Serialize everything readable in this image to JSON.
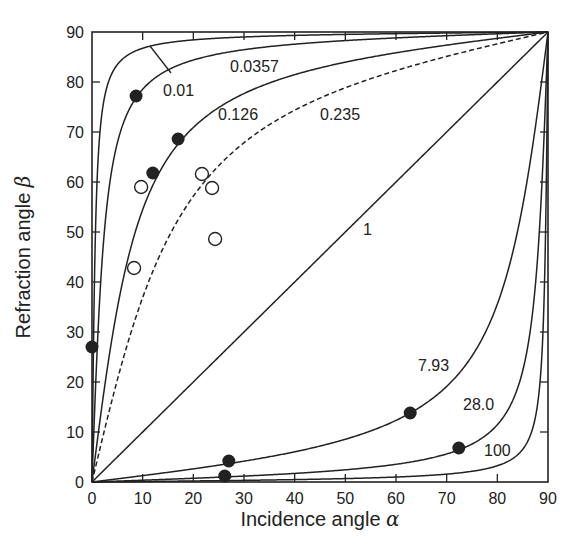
{
  "chart_data": {
    "type": "line",
    "title": "",
    "xlabel": "Incidence angle α",
    "ylabel": "Refraction angle β",
    "xlim": [
      0,
      90
    ],
    "ylim": [
      0,
      90
    ],
    "grid": false,
    "legend": "none (inline curve labels)",
    "x_ticks": [
      0,
      10,
      20,
      30,
      40,
      50,
      60,
      70,
      80,
      90
    ],
    "y_ticks": [
      0,
      10,
      20,
      30,
      40,
      50,
      60,
      70,
      80,
      90
    ],
    "relation": "tan(β) = tan(α) / k",
    "series": [
      {
        "name": "0.01",
        "k": 0.01,
        "style": "solid",
        "label_pos": [
          163,
          96
        ]
      },
      {
        "name": "0.0357",
        "k": 0.0357,
        "style": "solid",
        "label_pos": [
          230,
          72
        ]
      },
      {
        "name": "0.126",
        "k": 0.126,
        "style": "solid",
        "label_pos": [
          218,
          120
        ]
      },
      {
        "name": "0.235",
        "k": 0.235,
        "style": "dashed",
        "label_pos": [
          320,
          120
        ]
      },
      {
        "name": "1",
        "k": 1,
        "style": "solid",
        "label_pos": [
          363,
          235
        ]
      },
      {
        "name": "7.93",
        "k": 7.93,
        "style": "solid",
        "label_pos": [
          418,
          371
        ]
      },
      {
        "name": "28.0",
        "k": 28.0,
        "style": "solid",
        "label_pos": [
          463,
          410
        ]
      },
      {
        "name": "100",
        "k": 100,
        "style": "solid",
        "label_pos": [
          484,
          456
        ]
      }
    ],
    "scatter_filled": [
      {
        "x": 0,
        "y": 27
      },
      {
        "x": 8.7,
        "y": 77.2
      },
      {
        "x": 12,
        "y": 61.8
      },
      {
        "x": 17,
        "y": 68.6
      },
      {
        "x": 26.2,
        "y": 1.2
      },
      {
        "x": 27,
        "y": 4.2
      },
      {
        "x": 62.8,
        "y": 13.8
      },
      {
        "x": 72.4,
        "y": 6.8
      }
    ],
    "scatter_open": [
      {
        "x": 8.3,
        "y": 42.8
      },
      {
        "x": 9.7,
        "y": 59
      },
      {
        "x": 21.7,
        "y": 61.6
      },
      {
        "x": 23.7,
        "y": 58.8
      },
      {
        "x": 24.3,
        "y": 48.6
      }
    ],
    "annotations": [
      {
        "text": "0.01",
        "pointer": [
          [
            150,
            46
          ],
          [
            171,
            73
          ]
        ]
      }
    ]
  },
  "colors": {
    "line": "#222222",
    "background": "#ffffff"
  }
}
